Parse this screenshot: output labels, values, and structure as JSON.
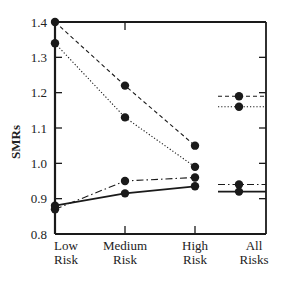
{
  "chart_data": {
    "type": "line",
    "title": "",
    "xlabel": "",
    "ylabel": "SMRs",
    "ylim": [
      0.8,
      1.4
    ],
    "yticks": [
      "0.8",
      "0.9",
      "1.0",
      "1.1",
      "1.2",
      "1.3",
      "1.4"
    ],
    "categories": [
      {
        "line1": "Low",
        "line2": "Risk"
      },
      {
        "line1": "Medium",
        "line2": "Risk"
      },
      {
        "line1": "High",
        "line2": "Risk"
      },
      {
        "line1": "All",
        "line2": "Risks"
      }
    ],
    "grid": false,
    "legend": null,
    "series": [
      {
        "name": "dashed",
        "style": "dashed",
        "values": [
          1.4,
          1.22,
          1.05,
          1.19
        ]
      },
      {
        "name": "dotted",
        "style": "dotted",
        "values": [
          1.34,
          1.13,
          0.99,
          1.16
        ]
      },
      {
        "name": "dash-dot",
        "style": "dashdot",
        "values": [
          0.87,
          0.95,
          0.96,
          0.94
        ]
      },
      {
        "name": "solid",
        "style": "solid",
        "values": [
          0.88,
          0.915,
          0.935,
          0.92
        ]
      }
    ],
    "note": "All Risks values are shown as short horizontal reference segments with a marker, not connected to the other categories."
  },
  "colors": {
    "ink": "#1a1a1a",
    "background": "#ffffff"
  }
}
